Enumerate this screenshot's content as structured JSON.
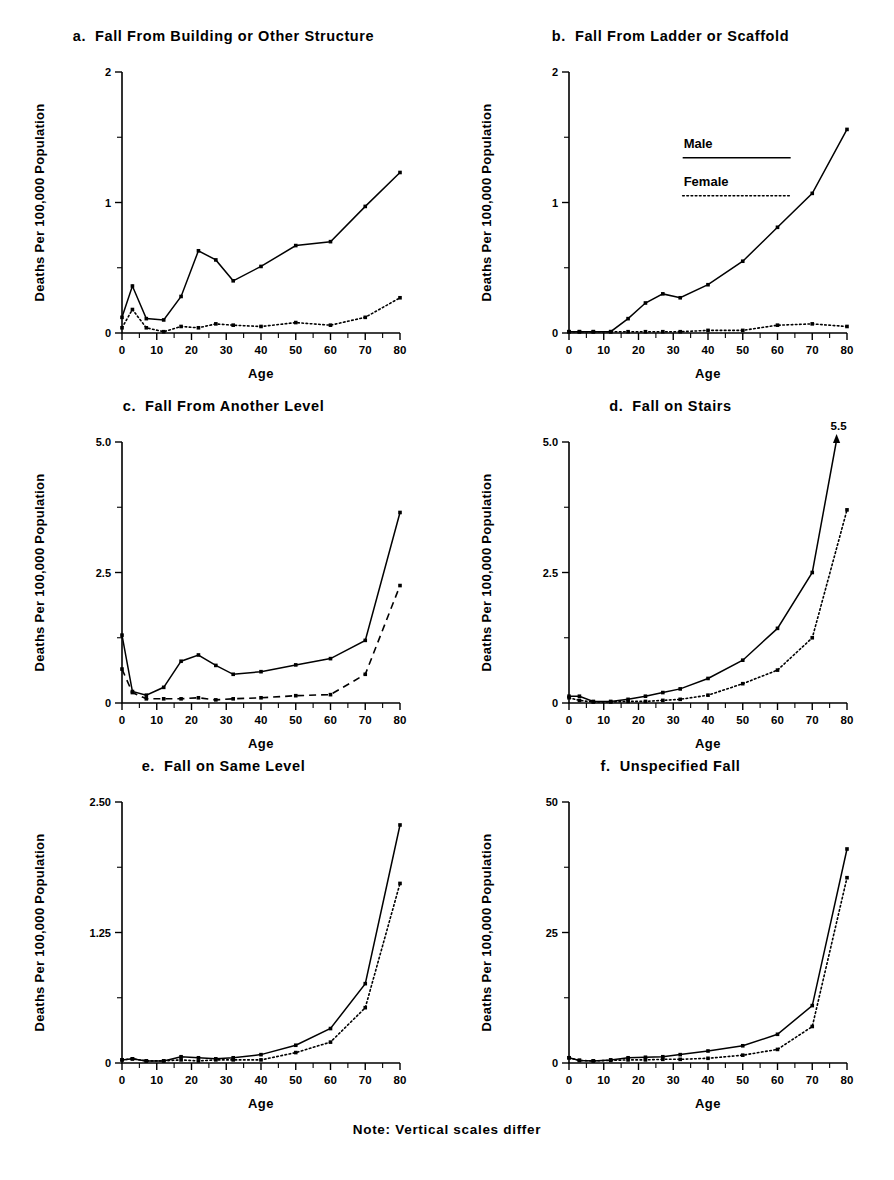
{
  "figure": {
    "note": "Note: Vertical scales differ",
    "y_axis_label": "Deaths Per 100,000 Population",
    "x_axis_label": "Age",
    "legend": {
      "male_label": "Male",
      "female_label": "Female",
      "panel_with_legend": "b"
    }
  },
  "chart_data": [
    {
      "id": "a",
      "type": "line",
      "panel_letter": "a.",
      "title": "Fall From Building or Other Structure",
      "xlabel": "Age",
      "ylabel": "Deaths Per 100,000 Population",
      "x": [
        0,
        3,
        7,
        12,
        17,
        22,
        27,
        32,
        40,
        50,
        60,
        70,
        80
      ],
      "xlim": [
        0,
        80
      ],
      "ylim": [
        0,
        2
      ],
      "xticks": [
        0,
        10,
        20,
        30,
        40,
        50,
        60,
        70,
        80
      ],
      "xtick_labels": [
        "0",
        "10",
        "20",
        "30",
        "40",
        "50",
        "60",
        "70",
        "80"
      ],
      "yticks": [
        0,
        1,
        2
      ],
      "ytick_labels": [
        "0",
        "1",
        "2"
      ],
      "grid": false,
      "series": [
        {
          "name": "Male",
          "style": "solid",
          "values": [
            0.12,
            0.36,
            0.11,
            0.1,
            0.28,
            0.63,
            0.56,
            0.4,
            0.51,
            0.67,
            0.7,
            0.97,
            1.23
          ]
        },
        {
          "name": "Female",
          "style": "dotted",
          "values": [
            0.04,
            0.18,
            0.04,
            0.01,
            0.05,
            0.04,
            0.07,
            0.06,
            0.05,
            0.08,
            0.06,
            0.12,
            0.27
          ]
        }
      ]
    },
    {
      "id": "b",
      "type": "line",
      "panel_letter": "b.",
      "title": "Fall From Ladder or Scaffold",
      "xlabel": "Age",
      "ylabel": "Deaths Per 100,000 Population",
      "x": [
        0,
        3,
        7,
        12,
        17,
        22,
        27,
        32,
        40,
        50,
        60,
        70,
        80
      ],
      "xlim": [
        0,
        80
      ],
      "ylim": [
        0,
        2
      ],
      "xticks": [
        0,
        10,
        20,
        30,
        40,
        50,
        60,
        70,
        80
      ],
      "xtick_labels": [
        "0",
        "10",
        "20",
        "30",
        "40",
        "50",
        "60",
        "70",
        "80"
      ],
      "yticks": [
        0,
        1,
        2
      ],
      "ytick_labels": [
        "0",
        "1",
        "2"
      ],
      "grid": false,
      "series": [
        {
          "name": "Male",
          "style": "solid",
          "values": [
            0.01,
            0.01,
            0.01,
            0.01,
            0.11,
            0.23,
            0.3,
            0.27,
            0.37,
            0.55,
            0.81,
            1.07,
            1.56
          ]
        },
        {
          "name": "Female",
          "style": "dotted",
          "values": [
            0.01,
            0.01,
            0.01,
            0.01,
            0.01,
            0.01,
            0.01,
            0.01,
            0.02,
            0.02,
            0.06,
            0.07,
            0.05
          ]
        }
      ]
    },
    {
      "id": "c",
      "type": "line",
      "panel_letter": "c.",
      "title": "Fall From Another Level",
      "xlabel": "Age",
      "ylabel": "Deaths Per 100,000 Population",
      "x": [
        0,
        3,
        7,
        12,
        17,
        22,
        27,
        32,
        40,
        50,
        60,
        70,
        80
      ],
      "xlim": [
        0,
        80
      ],
      "ylim": [
        0,
        5.0
      ],
      "xticks": [
        0,
        10,
        20,
        30,
        40,
        50,
        60,
        70,
        80
      ],
      "xtick_labels": [
        "0",
        "10",
        "20",
        "30",
        "40",
        "50",
        "60",
        "70",
        "80"
      ],
      "yticks": [
        0,
        2.5,
        5.0
      ],
      "ytick_labels": [
        "0",
        "2.5",
        "5.0"
      ],
      "grid": false,
      "series": [
        {
          "name": "Male",
          "style": "solid",
          "values": [
            1.3,
            0.22,
            0.15,
            0.3,
            0.8,
            0.92,
            0.72,
            0.55,
            0.6,
            0.73,
            0.85,
            1.2,
            3.65
          ]
        },
        {
          "name": "Female",
          "style": "dashed",
          "values": [
            0.65,
            0.2,
            0.08,
            0.08,
            0.08,
            0.1,
            0.06,
            0.08,
            0.1,
            0.14,
            0.16,
            0.55,
            2.25
          ]
        }
      ]
    },
    {
      "id": "d",
      "type": "line",
      "panel_letter": "d.",
      "title": "Fall on Stairs",
      "xlabel": "Age",
      "ylabel": "Deaths Per 100,000 Population",
      "x": [
        0,
        3,
        7,
        12,
        17,
        22,
        27,
        32,
        40,
        50,
        60,
        70,
        80
      ],
      "xlim": [
        0,
        80
      ],
      "ylim": [
        0,
        5.0
      ],
      "xticks": [
        0,
        10,
        20,
        30,
        40,
        50,
        60,
        70,
        80
      ],
      "xtick_labels": [
        "0",
        "10",
        "20",
        "30",
        "40",
        "50",
        "60",
        "70",
        "80"
      ],
      "yticks": [
        0,
        2.5,
        5.0
      ],
      "ytick_labels": [
        "0",
        "2.5",
        "5.0"
      ],
      "grid": false,
      "annotation": {
        "text": "5.5",
        "x": 80,
        "y": 5.5,
        "arrow": true
      },
      "series": [
        {
          "name": "Male",
          "style": "solid",
          "values": [
            0.13,
            0.13,
            0.03,
            0.03,
            0.07,
            0.13,
            0.2,
            0.27,
            0.47,
            0.82,
            1.43,
            2.5,
            5.5
          ]
        },
        {
          "name": "Female",
          "style": "dotted",
          "values": [
            0.1,
            0.05,
            0.02,
            0.02,
            0.03,
            0.03,
            0.05,
            0.07,
            0.15,
            0.37,
            0.63,
            1.25,
            3.7
          ]
        }
      ]
    },
    {
      "id": "e",
      "type": "line",
      "panel_letter": "e.",
      "title": "Fall on Same Level",
      "xlabel": "Age",
      "ylabel": "Deaths Per 100,000 Population",
      "x": [
        0,
        3,
        7,
        12,
        17,
        22,
        27,
        32,
        40,
        50,
        60,
        70,
        80
      ],
      "xlim": [
        0,
        80
      ],
      "ylim": [
        0,
        2.5
      ],
      "xticks": [
        0,
        10,
        20,
        30,
        40,
        50,
        60,
        70,
        80
      ],
      "xtick_labels": [
        "0",
        "10",
        "20",
        "30",
        "40",
        "50",
        "60",
        "70",
        "80"
      ],
      "yticks": [
        0,
        1.25,
        2.5
      ],
      "ytick_labels": [
        "0",
        "1.25",
        "2.50"
      ],
      "grid": false,
      "series": [
        {
          "name": "Male",
          "style": "solid",
          "values": [
            0.03,
            0.04,
            0.02,
            0.02,
            0.06,
            0.05,
            0.04,
            0.05,
            0.08,
            0.17,
            0.33,
            0.76,
            2.28
          ]
        },
        {
          "name": "Female",
          "style": "dotted",
          "values": [
            0.03,
            0.04,
            0.02,
            0.02,
            0.03,
            0.02,
            0.03,
            0.03,
            0.03,
            0.1,
            0.2,
            0.53,
            1.72
          ]
        }
      ]
    },
    {
      "id": "f",
      "type": "line",
      "panel_letter": "f.",
      "title": "Unspecified Fall",
      "xlabel": "Age",
      "ylabel": "Deaths Per 100,000 Population",
      "x": [
        0,
        3,
        7,
        12,
        17,
        22,
        27,
        32,
        40,
        50,
        60,
        70,
        80
      ],
      "xlim": [
        0,
        80
      ],
      "ylim": [
        0,
        50
      ],
      "xticks": [
        0,
        10,
        20,
        30,
        40,
        50,
        60,
        70,
        80
      ],
      "xtick_labels": [
        "0",
        "10",
        "20",
        "30",
        "40",
        "50",
        "60",
        "70",
        "80"
      ],
      "yticks": [
        0,
        25,
        50
      ],
      "ytick_labels": [
        "0",
        "25",
        "50"
      ],
      "grid": false,
      "series": [
        {
          "name": "Male",
          "style": "solid",
          "values": [
            1.0,
            0.5,
            0.4,
            0.6,
            1.0,
            1.1,
            1.2,
            1.6,
            2.3,
            3.3,
            5.5,
            11.0,
            41.0
          ]
        },
        {
          "name": "Female",
          "style": "dotted",
          "values": [
            1.0,
            0.5,
            0.4,
            0.5,
            0.6,
            0.6,
            0.7,
            0.7,
            0.9,
            1.5,
            2.6,
            7.0,
            35.5
          ]
        }
      ]
    }
  ]
}
